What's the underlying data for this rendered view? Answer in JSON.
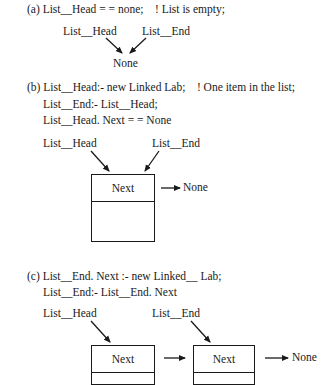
{
  "section_a": {
    "code": "(a) List__Head = = none;    ! List is empty;",
    "labels": {
      "head": "List__Head",
      "end": "List__End",
      "target": "None"
    }
  },
  "section_b": {
    "code_line1": "(b) List__Head:- new Linked Lab;    ! One item in the list;",
    "code_line2": "List__End:- List__Head;",
    "code_line3": "List__Head. Next = = None",
    "labels": {
      "head": "List__Head",
      "end": "List__End",
      "none": "None"
    },
    "node": {
      "field": "Next"
    }
  },
  "section_c": {
    "code_line1": "(c) List__End. Next :- new Linked__ Lab;",
    "code_line2": "List__End:- List__End. Next",
    "labels": {
      "head": "List__Head",
      "end": "List__End",
      "none": "None"
    },
    "nodes": [
      {
        "field": "Next"
      },
      {
        "field": "Next"
      }
    ]
  }
}
